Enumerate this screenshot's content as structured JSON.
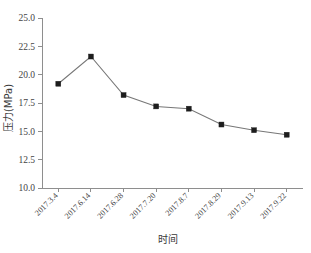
{
  "chart_data": {
    "type": "line",
    "title": "",
    "xlabel": "时间",
    "ylabel": "压力(MPa)",
    "categories": [
      "2017.3.4",
      "2017.6.14",
      "2017.6.28",
      "2017.7.20",
      "2017.8.7",
      "2017.8.29",
      "2017.9.13",
      "2017.9.22"
    ],
    "values": [
      19.2,
      21.6,
      18.2,
      17.2,
      17.0,
      15.6,
      15.1,
      14.7
    ],
    "series": [
      {
        "name": "压力",
        "values": [
          19.2,
          21.6,
          18.2,
          17.2,
          17.0,
          15.6,
          15.1,
          14.7
        ]
      }
    ],
    "ylim": [
      10.0,
      25.0
    ],
    "yticks": [
      "10.0",
      "12.5",
      "15.0",
      "17.5",
      "20.0",
      "22.5",
      "25.0"
    ],
    "ytick_values": [
      10.0,
      12.5,
      15.0,
      17.5,
      20.0,
      22.5,
      25.0
    ],
    "grid": false,
    "legend": null,
    "legend_position": "none",
    "marker": "square",
    "marker_color": "#1d1d1d",
    "line_color": "#777777",
    "axis_color": "#8e8e8e",
    "background_color": "#ffffff",
    "xtick_label_rotation": -45
  }
}
